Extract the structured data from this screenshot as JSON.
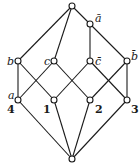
{
  "diagram": {
    "type": "hasse-lattice",
    "nodes": [
      {
        "id": "top",
        "x": 72,
        "y": 6,
        "label": ""
      },
      {
        "id": "abar",
        "x": 90,
        "y": 24,
        "label": "ā",
        "lx": 95,
        "ly": 22
      },
      {
        "id": "b",
        "x": 18,
        "y": 61,
        "label": "b",
        "lx": 8,
        "ly": 64
      },
      {
        "id": "c",
        "x": 54,
        "y": 61,
        "label": "c",
        "lx": 44,
        "ly": 64
      },
      {
        "id": "cbar",
        "x": 90,
        "y": 61,
        "label": "c̄",
        "lx": 95,
        "ly": 64
      },
      {
        "id": "bbar",
        "x": 127,
        "y": 61,
        "label": "b̄",
        "lx": 131,
        "ly": 58
      },
      {
        "id": "n4",
        "x": 18,
        "y": 100,
        "label": "a",
        "lx": 8,
        "ly": 99,
        "sublabel": "4",
        "slx": 8,
        "sly": 112
      },
      {
        "id": "n1",
        "x": 54,
        "y": 100,
        "label": "1",
        "lx": 43,
        "ly": 112
      },
      {
        "id": "n2",
        "x": 90,
        "y": 100,
        "label": "2",
        "lx": 95,
        "ly": 112
      },
      {
        "id": "n3",
        "x": 127,
        "y": 100,
        "label": "3",
        "lx": 131,
        "ly": 112
      },
      {
        "id": "bottom",
        "x": 72,
        "y": 159,
        "label": ""
      }
    ],
    "edges": [
      [
        "top",
        "b"
      ],
      [
        "top",
        "c"
      ],
      [
        "top",
        "abar"
      ],
      [
        "abar",
        "cbar"
      ],
      [
        "abar",
        "bbar"
      ],
      [
        "b",
        "n4"
      ],
      [
        "b",
        "n1"
      ],
      [
        "c",
        "n4"
      ],
      [
        "c",
        "n2"
      ],
      [
        "cbar",
        "n1"
      ],
      [
        "cbar",
        "n3"
      ],
      [
        "bbar",
        "n2"
      ],
      [
        "bbar",
        "n3"
      ],
      [
        "n4",
        "bottom"
      ],
      [
        "n1",
        "bottom"
      ],
      [
        "n2",
        "bottom"
      ],
      [
        "n3",
        "bottom"
      ]
    ],
    "labels": {
      "abar": "ā",
      "b": "b",
      "c": "c",
      "cbar": "c̄",
      "bbar": "b̄",
      "a": "a",
      "n4": "4",
      "n1": "1",
      "n2": "2",
      "n3": "3"
    },
    "colors": {
      "stroke": "#1a1a1a",
      "background": "#ffffff"
    }
  }
}
